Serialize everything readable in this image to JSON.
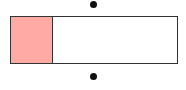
{
  "diagram": {
    "type": "fraction-bar",
    "total_parts": 4,
    "shaded_parts": 1,
    "colors": {
      "shaded": "#ffaaa5",
      "unshaded": "#ffffff",
      "border": "#333333",
      "dot": "#111111"
    },
    "dots": [
      {
        "position": "top",
        "x": 94,
        "y": 4
      },
      {
        "position": "bottom",
        "x": 94,
        "y": 77
      }
    ]
  }
}
